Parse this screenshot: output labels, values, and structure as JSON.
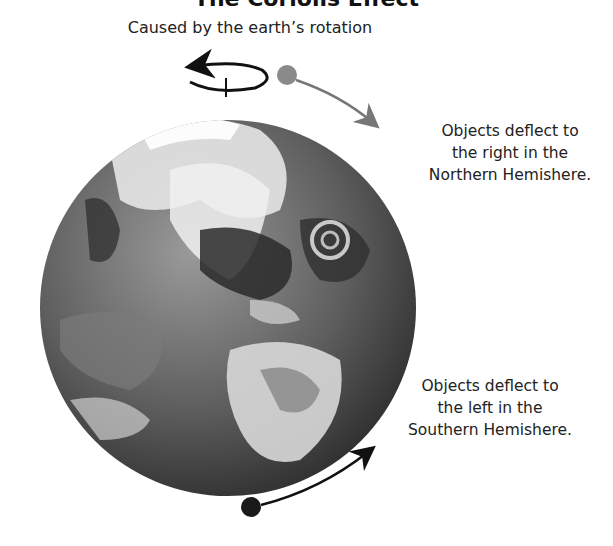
{
  "title": "The Coriolis Effect",
  "subtitle": "Caused by the earth’s rotation",
  "notes": {
    "north": [
      "Objects deflect to",
      "the right in the",
      "Northern Hemishere."
    ],
    "south": [
      "Objects deflect to",
      "the left in the",
      "Southern Hemishere."
    ]
  },
  "colors": {
    "north_object": "#8a8a8a",
    "south_object": "#1a1a1a",
    "rotation_arrow": "#111111",
    "earth_dark": "#3a3a3a",
    "earth_light": "#e8e8e8"
  },
  "icons": {
    "rotation": "counterclockwise-rotation-arrow-icon",
    "north_path": "curved-arrow-right-icon",
    "south_path": "curved-arrow-up-right-icon"
  }
}
